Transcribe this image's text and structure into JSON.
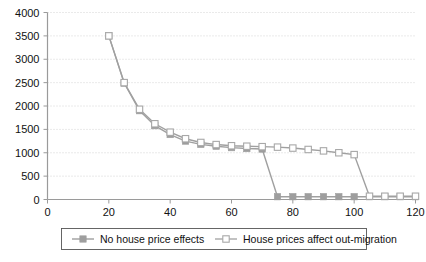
{
  "chart_data": {
    "type": "line",
    "title": "",
    "subtitle": "",
    "xlabel": "",
    "ylabel": "",
    "xlim": [
      0,
      120
    ],
    "ylim": [
      0,
      4000
    ],
    "grid": true,
    "grid_orientation": "horizontal",
    "legend_position": "bottom",
    "x_ticks": [
      0,
      20,
      40,
      60,
      80,
      100,
      120
    ],
    "x_tick_labels": [
      "0",
      "20",
      "40",
      "60",
      "80",
      "100",
      "120"
    ],
    "y_ticks": [
      0,
      500,
      1000,
      1500,
      2000,
      2500,
      3000,
      3500,
      4000
    ],
    "y_tick_labels": [
      "0",
      "500",
      "1000",
      "1500",
      "2000",
      "2500",
      "3000",
      "3500",
      "4000"
    ],
    "x": [
      20,
      25,
      30,
      35,
      40,
      45,
      50,
      55,
      60,
      65,
      70,
      75,
      80,
      85,
      90,
      95,
      100,
      105,
      110,
      115,
      120
    ],
    "series": [
      {
        "name": "No house price effects",
        "marker": "filled-square",
        "color": "#9e9e9e",
        "values": [
          3500,
          2490,
          1900,
          1580,
          1390,
          1250,
          1180,
          1140,
          1110,
          1090,
          1080,
          60,
          60,
          60,
          60,
          60,
          60,
          60,
          60,
          60,
          60
        ]
      },
      {
        "name": "House prices affect out-migration",
        "marker": "open-square",
        "color": "#a8a8a8",
        "values": [
          3500,
          2500,
          1930,
          1620,
          1440,
          1300,
          1220,
          1175,
          1150,
          1140,
          1130,
          1120,
          1100,
          1070,
          1040,
          1000,
          960,
          70,
          70,
          70,
          70
        ]
      }
    ]
  },
  "legend": {
    "items": [
      {
        "label": "No house price effects",
        "marker": "filled-square"
      },
      {
        "label": "House prices affect out-migration",
        "marker": "open-square"
      }
    ]
  }
}
